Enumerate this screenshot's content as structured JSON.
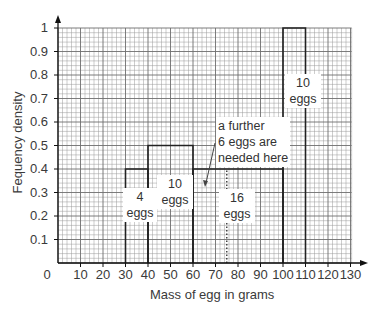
{
  "chart_data": {
    "type": "bar",
    "subtype": "histogram",
    "title": "",
    "xlabel": "Mass of egg in grams",
    "ylabel": "Fequency density",
    "xlim": [
      0,
      130
    ],
    "ylim": [
      0,
      1
    ],
    "grid": true,
    "x_ticks": [
      0,
      10,
      20,
      30,
      40,
      50,
      60,
      70,
      80,
      90,
      100,
      110,
      120,
      130
    ],
    "y_ticks": [
      0.1,
      0.2,
      0.3,
      0.4,
      0.5,
      0.6,
      0.7,
      0.8,
      0.9,
      1
    ],
    "bins": [
      {
        "from": 30,
        "to": 40,
        "frequency_density": 0.4,
        "label": "4 eggs"
      },
      {
        "from": 40,
        "to": 60,
        "frequency_density": 0.5,
        "label": "10 eggs"
      },
      {
        "from": 60,
        "to": 100,
        "frequency_density": 0.4,
        "label": "16 eggs"
      },
      {
        "from": 100,
        "to": 110,
        "frequency_density": 1.0,
        "label": "10 eggs"
      }
    ],
    "dotted_line_x": 75,
    "annotations": [
      {
        "text": "a further 6 eggs are needed here",
        "arrow_to": [
          64,
          0.4
        ]
      }
    ]
  },
  "labels": {
    "xlabel": "Mass of egg in grams",
    "ylabel": "Fequency density",
    "yticks": [
      "1",
      "0.9",
      "0.8",
      "0.7",
      "0.6",
      "0.5",
      "0.4",
      "0.3",
      "0.2",
      "0.1"
    ],
    "xticks": [
      "0",
      "10",
      "20",
      "30",
      "40",
      "50",
      "60",
      "70",
      "80",
      "90",
      "100",
      "110",
      "120",
      "130"
    ],
    "bin1_count": "4",
    "bin1_unit": "eggs",
    "bin2_count": "10",
    "bin2_unit": "eggs",
    "bin3_count": "16",
    "bin3_unit": "eggs",
    "bin4_count": "10",
    "bin4_unit": "eggs",
    "note_line1": "a further",
    "note_line2": "6 eggs are",
    "note_line3": "needed here"
  }
}
